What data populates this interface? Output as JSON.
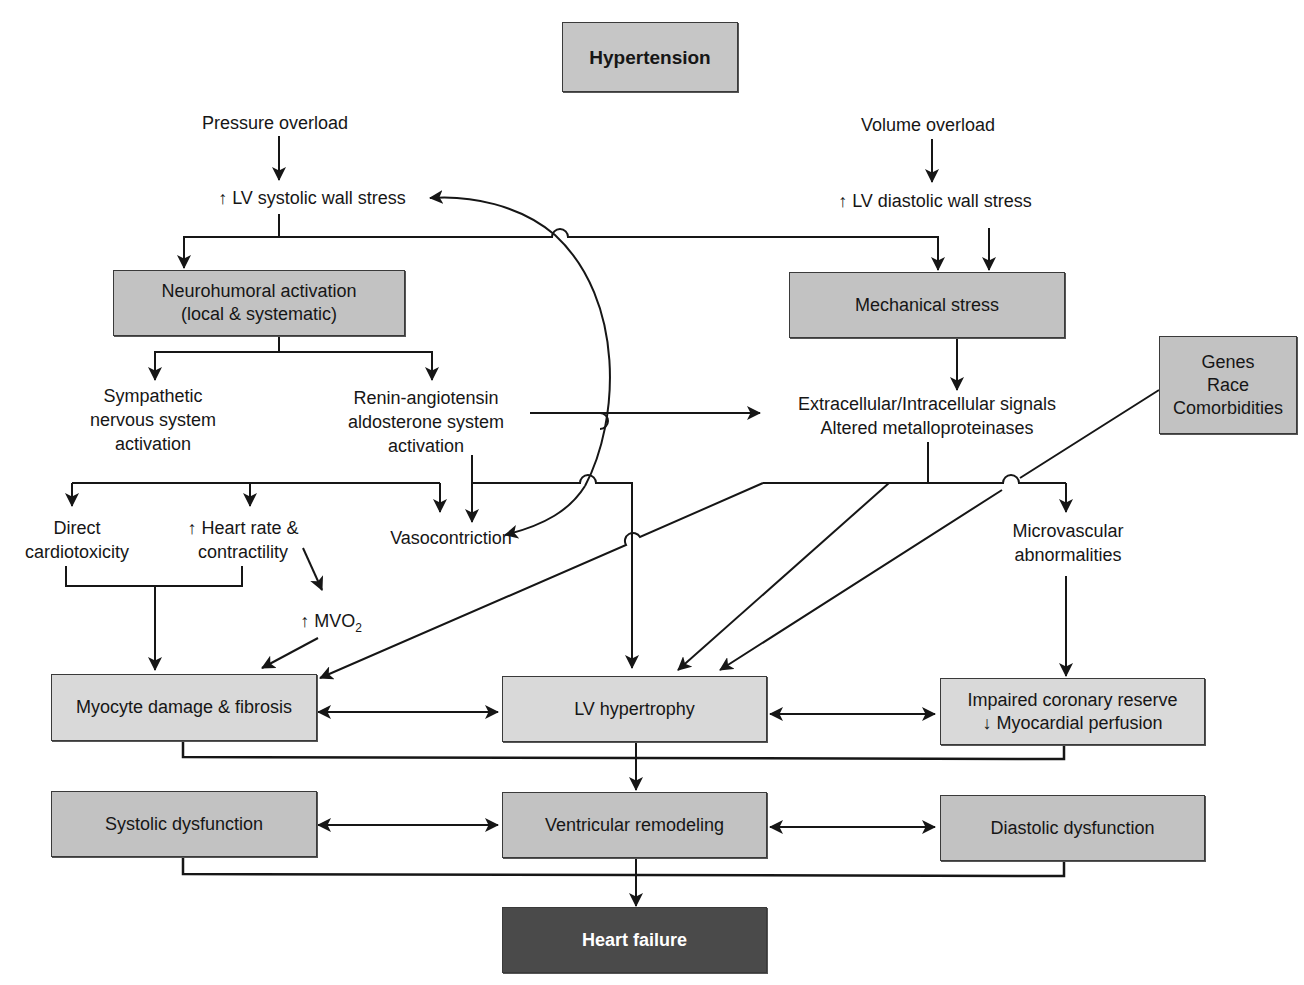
{
  "diagram": {
    "title": "Hypertension",
    "inputs": {
      "pressure_overload": "Pressure overload",
      "volume_overload": "Volume overload",
      "lv_systolic_wall_stress": "↑ LV systolic wall stress",
      "lv_diastolic_wall_stress": "↑ LV diastolic wall stress"
    },
    "nodes": {
      "neurohumoral": {
        "line1": "Neurohumoral activation",
        "line2": "(local & systematic)"
      },
      "mechanical_stress": "Mechanical stress",
      "sympathetic": {
        "line1": "Sympathetic",
        "line2": "nervous system",
        "line3": "activation"
      },
      "raas": {
        "line1": "Renin-angiotensin",
        "line2": "aldosterone system",
        "line3": "activation"
      },
      "signals": {
        "line1": "Extracellular/Intracellular signals",
        "line2": "Altered metalloproteinases"
      },
      "genes": {
        "line1": "Genes",
        "line2": "Race",
        "line3": "Comorbidities"
      },
      "direct_cardiotoxicity": {
        "line1": "Direct",
        "line2": "cardiotoxicity"
      },
      "heart_rate": {
        "line1": "↑ Heart rate &",
        "line2": "contractility"
      },
      "vasoconstriction": "Vasocontriction",
      "mvo2": {
        "prefix": "↑ MVO",
        "sub": "2"
      },
      "microvascular": {
        "line1": "Microvascular",
        "line2": "abnormalities"
      },
      "myocyte_damage": "Myocyte damage & fibrosis",
      "lv_hypertrophy": "LV hypertrophy",
      "coronary_reserve": {
        "line1": "Impaired coronary reserve",
        "line2": "↓ Myocardial perfusion"
      },
      "systolic_dysfunction": "Systolic dysfunction",
      "ventricular_remodeling": "Ventricular remodeling",
      "diastolic_dysfunction": "Diastolic dysfunction",
      "heart_failure": "Heart failure"
    },
    "colors": {
      "box_light": "#d9d9d9",
      "box_mid": "#c2c2c2",
      "box_dark": "#4a4a4a",
      "line": "#161616"
    }
  }
}
